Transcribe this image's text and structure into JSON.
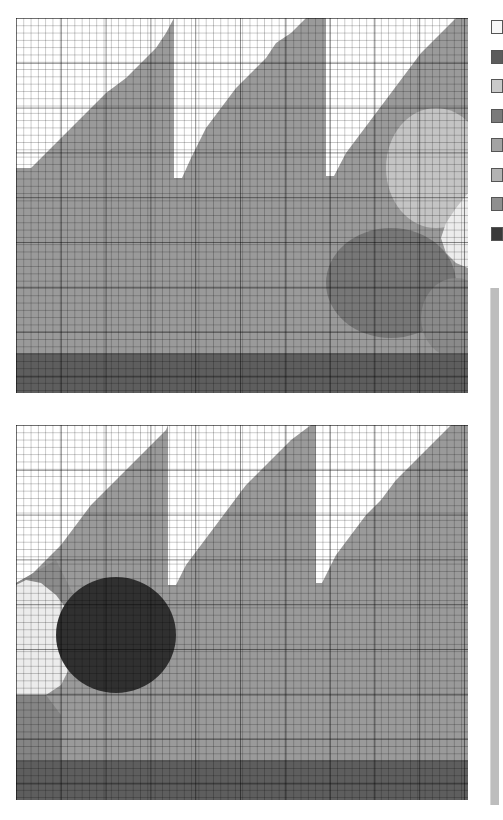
{
  "legend": {
    "swatches": [
      {
        "color": "#f7f7f7"
      },
      {
        "color": "#5c5c5c"
      },
      {
        "color": "#c9c9c9"
      },
      {
        "color": "#7a7a7a"
      },
      {
        "color": "#a3a3a3"
      },
      {
        "color": "#b3b3b3"
      },
      {
        "color": "#8f8f8f"
      },
      {
        "color": "#3a3a3a"
      }
    ]
  },
  "colors": {
    "empty": "#ffffff",
    "fill": "#9a9a9a",
    "floor": "#5e5e5e",
    "light": "#c4c4c4",
    "pale": "#ececec",
    "mid_dark": "#777777",
    "dark": "#303030",
    "mid": "#a8a8a8"
  },
  "panels": [
    {
      "id": "top",
      "regions": [
        {
          "name": "fill",
          "color": "#9a9a9a",
          "points": "0,150 15,150 30,135 45,120 60,105 75,90 90,75 110,60 125,45 140,30 150,15 158,0 158,160 166,160 175,140 190,110 205,90 220,70 235,55 250,40 260,25 275,15 290,0 310,0 310,158 318,158 330,135 345,115 360,95 375,75 390,55 405,35 420,20 435,5 440,0 452,0 452,335 0,335"
        },
        {
          "name": "light-circle",
          "color": "#c4c4c4",
          "ellipse": [
            420,
            150,
            50,
            60
          ]
        },
        {
          "name": "pale-region",
          "color": "#ececec",
          "points": "452,175 440,190 430,205 425,220 430,235 440,245 452,250"
        },
        {
          "name": "mid-dark-circle",
          "color": "#777777",
          "ellipse": [
            375,
            265,
            65,
            55
          ]
        },
        {
          "name": "lower-right-circle",
          "color": "#8a8a8a",
          "ellipse": [
            440,
            300,
            35,
            40
          ]
        },
        {
          "name": "floor",
          "color": "#5e5e5e",
          "points": "0,335 452,335 452,375 0,375"
        }
      ]
    },
    {
      "id": "bottom",
      "regions": [
        {
          "name": "fill",
          "color": "#9a9a9a",
          "points": "0,158 15,150 30,135 45,120 60,100 75,80 90,65 105,50 120,35 135,20 150,5 152,0 152,160 160,160 170,140 185,120 200,100 215,80 230,60 245,45 260,30 275,15 295,0 300,0 300,158 306,158 320,130 335,110 350,90 365,75 380,55 395,40 410,25 425,10 435,0 452,0 452,335 0,335"
        },
        {
          "name": "upper-left-wedge",
          "color": "#8c8c8c",
          "points": "0,158 40,135 60,175 50,195 0,170"
        },
        {
          "name": "pale-region",
          "color": "#ececec",
          "points": "0,160 10,155 25,158 40,170 55,190 60,210 55,240 45,260 30,270 0,270"
        },
        {
          "name": "dark-blob",
          "color": "#303030",
          "ellipse": [
            100,
            210,
            60,
            58
          ]
        },
        {
          "name": "left-lower",
          "color": "#858585",
          "points": "0,270 30,270 45,290 45,335 0,335"
        },
        {
          "name": "floor",
          "color": "#5e5e5e",
          "points": "0,335 452,335 452,375 0,375"
        }
      ]
    }
  ]
}
